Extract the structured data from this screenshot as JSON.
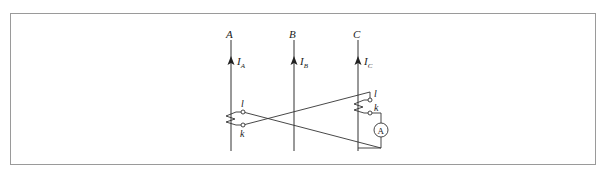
{
  "diagram": {
    "type": "circuit-schematic",
    "phases": [
      {
        "label": "A",
        "current_label": "I",
        "current_sub": "A"
      },
      {
        "label": "B",
        "current_label": "I",
        "current_sub": "B"
      },
      {
        "label": "C",
        "current_label": "I",
        "current_sub": "C"
      }
    ],
    "ct_left": {
      "terminal_top": "l",
      "terminal_bottom": "k"
    },
    "ct_right": {
      "terminal_top": "l",
      "terminal_bottom": "k"
    },
    "meter": {
      "label": "A"
    },
    "colors": {
      "line": "#333333",
      "frame": "#9a9a9a"
    }
  }
}
